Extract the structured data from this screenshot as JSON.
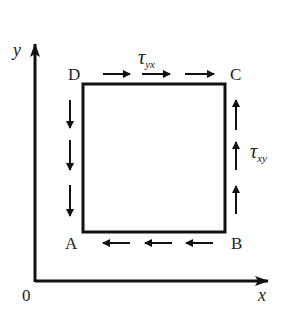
{
  "diagram": {
    "axes": {
      "x_label": "x",
      "y_label": "y",
      "origin_label": "0"
    },
    "corners": {
      "top_left": "D",
      "top_right": "C",
      "bottom_left": "A",
      "bottom_right": "B"
    },
    "stresses": {
      "top": {
        "symbol": "τ",
        "subscript": "yx",
        "direction": "right"
      },
      "right": {
        "symbol": "τ",
        "subscript": "xy",
        "direction": "up"
      },
      "bottom": {
        "direction": "left"
      },
      "left": {
        "direction": "down"
      }
    },
    "colors": {
      "stroke": "#111111",
      "background": "#ffffff"
    }
  }
}
